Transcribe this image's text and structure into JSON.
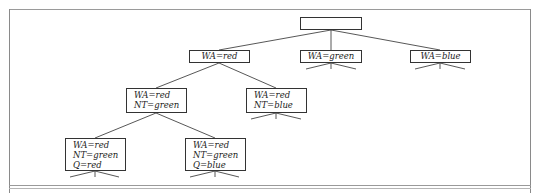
{
  "diagram": {
    "type": "search-tree",
    "nodes": [
      {
        "id": "root",
        "lines": [],
        "x": 300,
        "y": 17,
        "w": 62,
        "h": 13
      },
      {
        "id": "wa-red",
        "lines": [
          "WA=red"
        ],
        "x": 189,
        "y": 50,
        "w": 61,
        "h": 13
      },
      {
        "id": "wa-green",
        "lines": [
          "WA=green"
        ],
        "x": 300,
        "y": 50,
        "w": 62,
        "h": 13
      },
      {
        "id": "wa-blue",
        "lines": [
          "WA=blue"
        ],
        "x": 410,
        "y": 50,
        "w": 61,
        "h": 13
      },
      {
        "id": "wa-red-nt-green",
        "lines": [
          "WA=red",
          "NT=green"
        ],
        "x": 126,
        "y": 88,
        "w": 61,
        "h": 25
      },
      {
        "id": "wa-red-nt-blue",
        "lines": [
          "WA=red",
          "NT=blue"
        ],
        "x": 246,
        "y": 88,
        "w": 61,
        "h": 25
      },
      {
        "id": "wa-red-nt-green-q-red",
        "lines": [
          "WA=red",
          "NT=green",
          "Q=red"
        ],
        "x": 65,
        "y": 138,
        "w": 61,
        "h": 33
      },
      {
        "id": "wa-red-nt-green-q-blue",
        "lines": [
          "WA=red",
          "NT=green",
          "Q=blue"
        ],
        "x": 185,
        "y": 138,
        "w": 61,
        "h": 33
      }
    ],
    "edges": [
      [
        "root",
        "wa-red"
      ],
      [
        "root",
        "wa-green"
      ],
      [
        "root",
        "wa-blue"
      ],
      [
        "wa-red",
        "wa-red-nt-green"
      ],
      [
        "wa-red",
        "wa-red-nt-blue"
      ],
      [
        "wa-red-nt-green",
        "wa-red-nt-green-q-red"
      ],
      [
        "wa-red-nt-green",
        "wa-red-nt-green-q-blue"
      ]
    ],
    "stubs": [
      "wa-green",
      "wa-blue",
      "wa-red-nt-blue",
      "wa-red-nt-green-q-red",
      "wa-red-nt-green-q-blue"
    ]
  }
}
